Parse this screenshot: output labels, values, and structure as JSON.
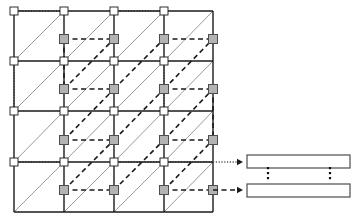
{
  "figure": {
    "title": "",
    "type": "mesh-connectivity-diagram",
    "colors": {
      "grid_line": "#1a1a1a",
      "diagonal_line": "#9a9a9a",
      "dashed_line": "#1a1a1a",
      "dotted_line": "#555555",
      "node_fill": "#b3b3b3",
      "node_stroke": "#4d4d4d",
      "corner_fill": "#ffffff",
      "corner_stroke": "#1a1a1a",
      "bar_fill": "#ffffff",
      "bar_stroke": "#4d4d4d",
      "dots": "#111111",
      "background": "#ffffff"
    },
    "grid": {
      "label": "4x4 cell mesh",
      "columns": 4,
      "rows": 4,
      "x_lines": [
        14,
        64,
        114,
        164,
        213
      ],
      "y_lines": [
        11,
        61,
        111,
        162,
        212
      ]
    },
    "corner_nodes": {
      "label": "grid-corner-markers",
      "size": 8,
      "points": [
        [
          14,
          11
        ],
        [
          64,
          11
        ],
        [
          114,
          11
        ],
        [
          164,
          11
        ],
        [
          14,
          61
        ],
        [
          64,
          61
        ],
        [
          114,
          61
        ],
        [
          164,
          61
        ],
        [
          14,
          111
        ],
        [
          64,
          111
        ],
        [
          114,
          111
        ],
        [
          164,
          111
        ],
        [
          14,
          162
        ],
        [
          64,
          162
        ],
        [
          114,
          162
        ],
        [
          164,
          162
        ]
      ]
    },
    "cell_nodes": {
      "label": "cell-center-markers",
      "size": 9,
      "points": [
        [
          64,
          39
        ],
        [
          114,
          39
        ],
        [
          164,
          39
        ],
        [
          213,
          39
        ],
        [
          64,
          89
        ],
        [
          114,
          89
        ],
        [
          164,
          89
        ],
        [
          213,
          89
        ],
        [
          64,
          140
        ],
        [
          114,
          140
        ],
        [
          164,
          140
        ],
        [
          213,
          140
        ],
        [
          64,
          190
        ],
        [
          114,
          190
        ],
        [
          164,
          190
        ],
        [
          213,
          190
        ]
      ]
    },
    "diagonals": {
      "label": "solid-diagonal-connections",
      "segments": [
        [
          14,
          61,
          64,
          11
        ],
        [
          64,
          61,
          114,
          11
        ],
        [
          114,
          61,
          164,
          11
        ],
        [
          164,
          61,
          213,
          11
        ],
        [
          14,
          111,
          64,
          61
        ],
        [
          64,
          111,
          114,
          61
        ],
        [
          114,
          111,
          164,
          61
        ],
        [
          164,
          111,
          213,
          61
        ],
        [
          14,
          162,
          64,
          111
        ],
        [
          64,
          162,
          114,
          111
        ],
        [
          114,
          162,
          164,
          111
        ],
        [
          164,
          162,
          213,
          111
        ],
        [
          14,
          212,
          64,
          162
        ],
        [
          64,
          212,
          114,
          162
        ],
        [
          114,
          212,
          164,
          162
        ],
        [
          164,
          212,
          213,
          162
        ]
      ]
    },
    "dashed_diagonals": {
      "label": "dashed-diagonal-connections",
      "segments": [
        [
          64,
          89,
          114,
          39
        ],
        [
          114,
          89,
          164,
          39
        ],
        [
          164,
          89,
          213,
          39
        ],
        [
          64,
          140,
          114,
          89
        ],
        [
          114,
          140,
          164,
          89
        ],
        [
          164,
          140,
          213,
          89
        ],
        [
          64,
          190,
          114,
          140
        ],
        [
          114,
          190,
          164,
          140
        ],
        [
          164,
          190,
          213,
          140
        ]
      ]
    },
    "dashed_horizontals": {
      "label": "dashed-horizontal-connections",
      "segments": [
        [
          64,
          39,
          114,
          39
        ],
        [
          164,
          39,
          213,
          39
        ],
        [
          64,
          89,
          114,
          89
        ],
        [
          164,
          89,
          213,
          89
        ],
        [
          64,
          140,
          114,
          140
        ],
        [
          164,
          140,
          213,
          140
        ],
        [
          64,
          190,
          114,
          190
        ],
        [
          164,
          190,
          213,
          190
        ]
      ]
    },
    "dashed_verticals": {
      "label": "dashed-vertical-connections",
      "segments": [
        [
          64,
          39,
          64,
          89
        ],
        [
          213,
          89,
          213,
          140
        ]
      ]
    },
    "dotted_horizontals": {
      "label": "dotted-horizontal-connections",
      "segments": [
        [
          14,
          11,
          64,
          11
        ],
        [
          114,
          11,
          164,
          11
        ],
        [
          14,
          162,
          64,
          162
        ],
        [
          114,
          162,
          164,
          162
        ],
        [
          164,
          162,
          213,
          162
        ]
      ]
    },
    "dotted_verticals": {
      "label": "dotted-vertical-connections",
      "segments": [
        [
          14,
          61,
          14,
          111
        ],
        [
          164,
          61,
          164,
          111
        ]
      ]
    },
    "arrows": [
      {
        "name": "dotted-arrow-to-top-bar",
        "style": "dotted",
        "from_x": 213,
        "from_y": 162,
        "to_x": 243,
        "to_y": 162
      },
      {
        "name": "dashed-arrow-to-bottom-bar",
        "style": "dashed",
        "from_x": 213,
        "from_y": 190,
        "to_x": 243,
        "to_y": 190
      }
    ],
    "bars": [
      {
        "name": "output-bar-top",
        "x": 247,
        "y": 155,
        "width": 103,
        "height": 13
      },
      {
        "name": "output-bar-bottom",
        "x": 247,
        "y": 184,
        "width": 103,
        "height": 13
      }
    ],
    "vertical_ellipses": [
      {
        "name": "vertical-ellipsis-left",
        "x": 268,
        "y": 172,
        "count": 3
      },
      {
        "name": "vertical-ellipsis-right",
        "x": 330,
        "y": 172,
        "count": 3
      }
    ]
  }
}
